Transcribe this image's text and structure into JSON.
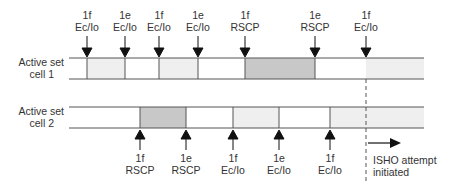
{
  "diagram": {
    "colors": {
      "line": "#555555",
      "light_fill": "#efefef",
      "dark_fill": "#c8c8c8",
      "text": "#333333"
    },
    "cell1": {
      "label_line1": "Active set",
      "label_line2": "cell 1",
      "events": [
        {
          "event": "1f",
          "measure": "Ec/Io"
        },
        {
          "event": "1e",
          "measure": "Ec/Io"
        },
        {
          "event": "1f",
          "measure": "Ec/Io"
        },
        {
          "event": "1e",
          "measure": "Ec/Io"
        },
        {
          "event": "1f",
          "measure": "RSCP"
        },
        {
          "event": "1e",
          "measure": "RSCP"
        },
        {
          "event": "1f",
          "measure": "Ec/Io"
        }
      ]
    },
    "cell2": {
      "label_line1": "Active set",
      "label_line2": "cell 2",
      "events": [
        {
          "event": "1f",
          "measure": "RSCP"
        },
        {
          "event": "1e",
          "measure": "RSCP"
        },
        {
          "event": "1f",
          "measure": "Ec/Io"
        },
        {
          "event": "1e",
          "measure": "Ec/Io"
        },
        {
          "event": "1f",
          "measure": "Ec/Io"
        }
      ]
    },
    "isho": {
      "line1": "ISHO attempt",
      "line2": "initiated"
    }
  }
}
